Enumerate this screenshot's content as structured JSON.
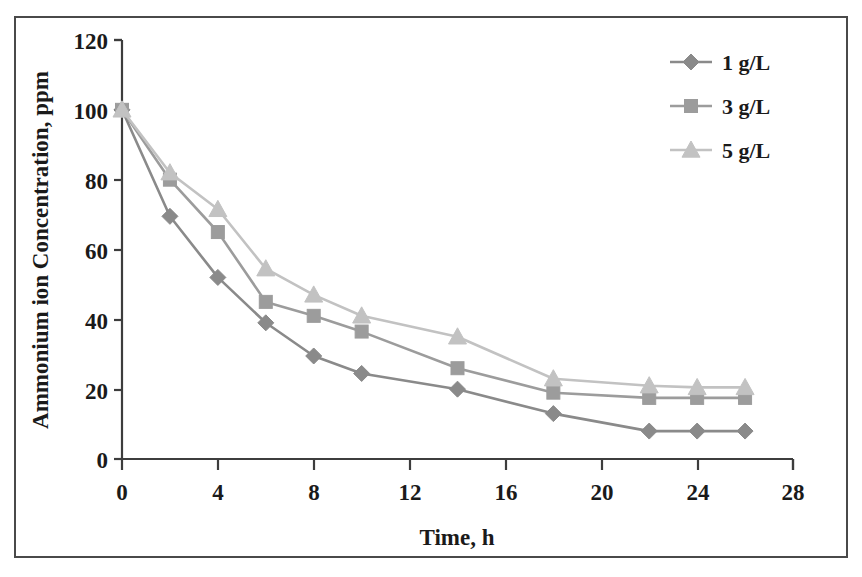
{
  "chart_data": {
    "type": "line",
    "title": "",
    "xlabel": "Time, h",
    "ylabel": "Ammonium ion Concentration, ppm",
    "xlim": [
      0,
      28
    ],
    "ylim": [
      0,
      120
    ],
    "xticks": [
      0,
      4,
      8,
      12,
      16,
      20,
      24,
      28
    ],
    "yticks": [
      0,
      20,
      40,
      60,
      80,
      100,
      120
    ],
    "grid": false,
    "legend_position": "top-right",
    "x": [
      0,
      2,
      4,
      6,
      8,
      10,
      14,
      18,
      22,
      24,
      26
    ],
    "series": [
      {
        "name": "1 g/L",
        "marker": "diamond",
        "color": "#8a8a8a",
        "values": [
          100,
          69.5,
          52,
          39,
          29.5,
          24.5,
          20,
          13,
          8,
          8,
          8
        ]
      },
      {
        "name": "3 g/L",
        "marker": "square",
        "color": "#9c9c9c",
        "values": [
          100,
          80,
          65,
          45,
          41,
          36.5,
          26,
          19,
          17.5,
          17.5,
          17.5
        ]
      },
      {
        "name": "5 g/L",
        "marker": "triangle",
        "color": "#c2c2c2",
        "values": [
          100,
          82,
          71.5,
          54.5,
          47,
          41,
          35,
          23,
          21,
          20.5,
          20.5
        ]
      }
    ]
  },
  "axes": {
    "x_title": "Time, h",
    "y_title": "Ammonium ion Concentration, ppm",
    "x_tick_labels": [
      "0",
      "4",
      "8",
      "12",
      "16",
      "20",
      "24",
      "28"
    ],
    "y_tick_labels": [
      "0",
      "20",
      "40",
      "60",
      "80",
      "100",
      "120"
    ]
  },
  "legend": {
    "entries": [
      {
        "label": "1 g/L",
        "marker": "diamond-marker",
        "color": "#8a8a8a"
      },
      {
        "label": "3 g/L",
        "marker": "square-marker",
        "color": "#9c9c9c"
      },
      {
        "label": "5 g/L",
        "marker": "triangle-marker",
        "color": "#c2c2c2"
      }
    ]
  },
  "colors": {
    "axis": "#3d3d3d",
    "text": "#1a1a1a",
    "frame": "#4a4a4a",
    "background": "#ffffff"
  }
}
